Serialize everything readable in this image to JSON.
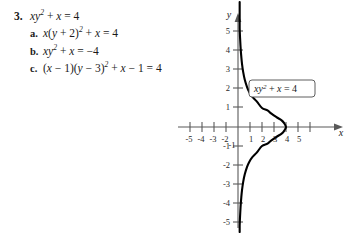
{
  "problem": {
    "number": "3.",
    "equation": {
      "text": "xy2 + x = 4",
      "parts": [
        "xy",
        "2",
        " + x = 4"
      ]
    },
    "choices": [
      {
        "letter": "a.",
        "text": "x(y + 2)2 + x = 4"
      },
      {
        "letter": "b.",
        "text": "xy2 + x = −4"
      },
      {
        "letter": "c.",
        "text": "(x − 1)(y − 3)2 + x − 1 = 4"
      }
    ]
  },
  "graph": {
    "x_axis_label": "x",
    "y_axis_label": "y",
    "curve_label": "xy2 + x = 4",
    "x_ticks": [
      "-5",
      "-4",
      "-3",
      "-2",
      "-1",
      "1",
      "2",
      "3",
      "4",
      "5"
    ],
    "y_ticks": [
      "5",
      "4",
      "3",
      "2",
      "1",
      "-1",
      "-2",
      "-3",
      "-4",
      "-5"
    ],
    "curve_color": "#000000",
    "axis_color": "#595959"
  },
  "chart_data": {
    "type": "line",
    "title": "",
    "xlabel": "x",
    "ylabel": "y",
    "xlim": [
      -5.8,
      5.8
    ],
    "ylim": [
      -5.8,
      5.8
    ],
    "grid": false,
    "legend": "none",
    "annotations": [
      {
        "text": "xy2 + x = 4",
        "x": 2.6,
        "y": 2.2
      }
    ],
    "xticks": [
      -5,
      -4,
      -3,
      -2,
      -1,
      1,
      2,
      3,
      4,
      5
    ],
    "yticks": [
      -5,
      -4,
      -3,
      -2,
      -1,
      1,
      2,
      3,
      4,
      5
    ],
    "series": [
      {
        "name": "xy^2 + x = 4",
        "equation": "x = 4/(1 + y^2)",
        "points": [
          {
            "x": 0.139,
            "y": -5.2
          },
          {
            "x": 0.16,
            "y": -4.85
          },
          {
            "x": 0.188,
            "y": -4.5
          },
          {
            "x": 0.225,
            "y": -4.1
          },
          {
            "x": 0.275,
            "y": -3.7
          },
          {
            "x": 0.339,
            "y": -3.3
          },
          {
            "x": 0.43,
            "y": -2.9
          },
          {
            "x": 0.559,
            "y": -2.5
          },
          {
            "x": 0.755,
            "y": -2.1
          },
          {
            "x": 0.925,
            "y": -1.85
          },
          {
            "x": 1.18,
            "y": -1.6
          },
          {
            "x": 1.561,
            "y": -1.35
          },
          {
            "x": 2.0,
            "y": -1.0
          },
          {
            "x": 2.462,
            "y": -0.875
          },
          {
            "x": 2.787,
            "y": -0.7
          },
          {
            "x": 3.252,
            "y": -0.5
          },
          {
            "x": 3.636,
            "y": -0.35
          },
          {
            "x": 3.846,
            "y": -0.2
          },
          {
            "x": 4.0,
            "y": 0.0
          },
          {
            "x": 3.846,
            "y": 0.2
          },
          {
            "x": 3.636,
            "y": 0.35
          },
          {
            "x": 3.252,
            "y": 0.5
          },
          {
            "x": 2.787,
            "y": 0.7
          },
          {
            "x": 2.462,
            "y": 0.875
          },
          {
            "x": 2.0,
            "y": 1.0
          },
          {
            "x": 1.561,
            "y": 1.35
          },
          {
            "x": 1.18,
            "y": 1.6
          },
          {
            "x": 0.925,
            "y": 1.85
          },
          {
            "x": 0.755,
            "y": 2.1
          },
          {
            "x": 0.559,
            "y": 2.5
          },
          {
            "x": 0.43,
            "y": 2.9
          },
          {
            "x": 0.339,
            "y": 3.3
          },
          {
            "x": 0.275,
            "y": 3.7
          },
          {
            "x": 0.225,
            "y": 4.1
          },
          {
            "x": 0.188,
            "y": 4.5
          },
          {
            "x": 0.16,
            "y": 4.85
          },
          {
            "x": 0.139,
            "y": 5.2
          }
        ]
      }
    ]
  }
}
